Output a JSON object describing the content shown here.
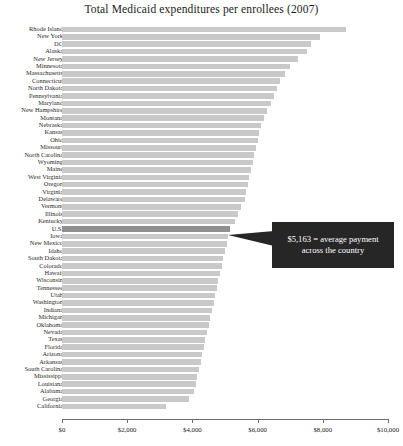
{
  "chart_data": {
    "type": "bar",
    "orientation": "horizontal",
    "title": "Total Medicaid expenditures per enrollees (2007)",
    "xlabel": "",
    "ylabel": "",
    "xlim": [
      0,
      10000
    ],
    "grid": false,
    "legend": null,
    "tick_labels": [
      "$0",
      "$2,000",
      "$4,000",
      "$6,000",
      "$8,000",
      "$10,000"
    ],
    "tick_values": [
      0,
      2000,
      4000,
      6000,
      8000,
      10000
    ],
    "highlight_category": "U.S.",
    "annotation": {
      "text": "$5,163 = average payment across the country",
      "value": 5163,
      "target": "U.S."
    },
    "categories": [
      "Rhode Island",
      "New York",
      "DC",
      "Alaska",
      "New Jersey",
      "Minnesota",
      "Massachusetts",
      "Connecticut",
      "North Dakota",
      "Pennsylvania",
      "Maryland",
      "New Hampshire",
      "Montana",
      "Nebraska",
      "Kansas",
      "Ohio",
      "Missouri",
      "North Carolina",
      "Wyoming",
      "Maine",
      "West Virginia",
      "Oregon",
      "Virginia",
      "Delaware",
      "Vermont",
      "Illinois",
      "Kentucky",
      "U.S.",
      "Iowa",
      "New Mexico",
      "Idaho",
      "South Dakota",
      "Colorado",
      "Hawaii",
      "Wisconsin",
      "Tennessee",
      "Utah",
      "Washington",
      "Indiana",
      "Michigan",
      "Oklahoma",
      "Nevada",
      "Texas",
      "Florida",
      "Arizona",
      "Arkansas",
      "South Carolina",
      "Mississippi",
      "Louisiana",
      "Alabama",
      "Georgia",
      "California"
    ],
    "values": [
      8700,
      7900,
      7650,
      7500,
      7250,
      7000,
      6850,
      6700,
      6600,
      6500,
      6400,
      6300,
      6200,
      6100,
      6050,
      6000,
      5950,
      5900,
      5850,
      5800,
      5750,
      5700,
      5650,
      5600,
      5500,
      5400,
      5300,
      5163,
      5100,
      5050,
      5000,
      4950,
      4900,
      4850,
      4800,
      4750,
      4700,
      4650,
      4600,
      4550,
      4500,
      4450,
      4400,
      4350,
      4300,
      4250,
      4200,
      4150,
      4100,
      4050,
      3900,
      3200
    ]
  }
}
